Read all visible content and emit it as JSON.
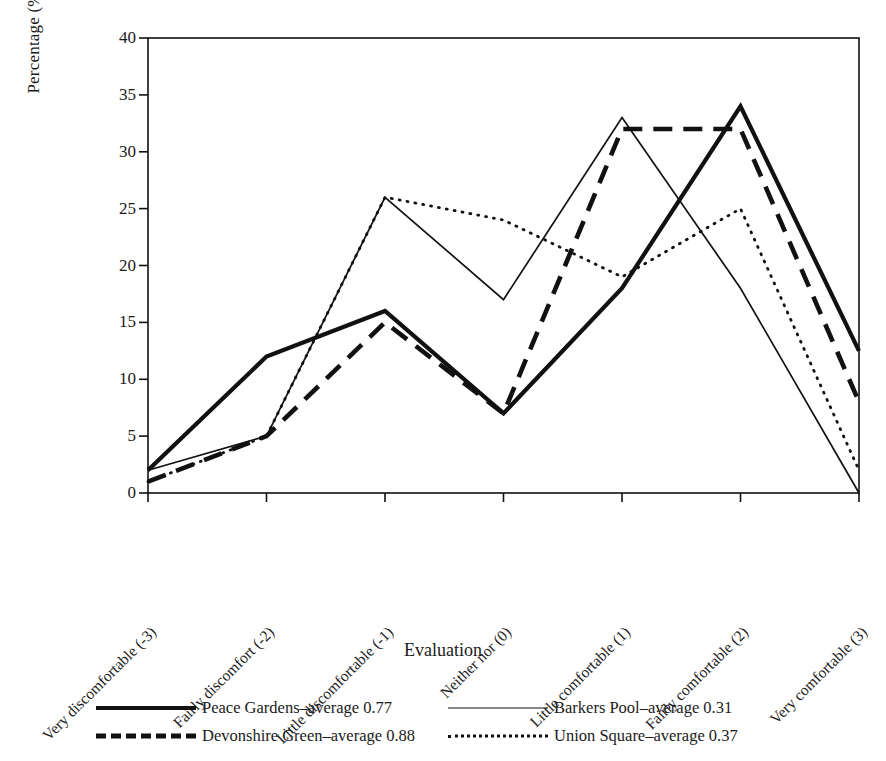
{
  "chart_data": {
    "type": "line",
    "title": "",
    "xlabel": "Evaluation",
    "ylabel": "Percentage (%)",
    "ylim": [
      0,
      40
    ],
    "ytick_step": 5,
    "yticks": [
      0,
      5,
      10,
      15,
      20,
      25,
      30,
      35,
      40
    ],
    "grid": false,
    "legend_position": "bottom",
    "categories": [
      "Very discomfortable (-3)",
      "Fairly discomfort (-2)",
      "Little discomfortable (-1)",
      "Neither nor (0)",
      "Little comfortable (1)",
      "Fairly comfortable (2)",
      "Very comfortable (3)"
    ],
    "series": [
      {
        "name": "Peace Gardens",
        "legend_label": "Peace Gardens–average 0.77",
        "average": 0.77,
        "style": "thick-solid",
        "values": [
          2,
          12,
          16,
          7,
          18,
          34,
          12.5
        ]
      },
      {
        "name": "Devonshire Green",
        "legend_label": "Devonshire Green–average 0.88",
        "average": 0.88,
        "style": "thick-dash",
        "values": [
          1,
          5,
          15,
          7,
          32,
          32,
          8
        ]
      },
      {
        "name": "Barkers Pool",
        "legend_label": "Barkers Pool–average 0.31",
        "average": 0.31,
        "style": "thin-solid",
        "values": [
          2,
          5,
          26,
          17,
          33,
          18,
          0
        ]
      },
      {
        "name": "Union Square",
        "legend_label": "Union  Square–average 0.37",
        "average": 0.37,
        "style": "dotted",
        "values": [
          1,
          5,
          26,
          24,
          19,
          25,
          2
        ]
      }
    ]
  },
  "axis": {
    "y_title": "Percentage (%)",
    "x_title": "Evaluation",
    "tick_0": "0",
    "tick_5": "5",
    "tick_10": "10",
    "tick_15": "15",
    "tick_20": "20",
    "tick_25": "25",
    "tick_30": "30",
    "tick_35": "35",
    "tick_40": "40"
  },
  "legend": {
    "items": [
      {
        "label": "Peace Gardens–average 0.77",
        "style": "thick-solid"
      },
      {
        "label": "Barkers Pool–average 0.31",
        "style": "thin-solid"
      },
      {
        "label": "Devonshire Green–average 0.88",
        "style": "thick-dash"
      },
      {
        "label": "Union  Square–average 0.37",
        "style": "dotted"
      }
    ]
  },
  "colors": {
    "ink": "#111111",
    "background": "#ffffff"
  }
}
